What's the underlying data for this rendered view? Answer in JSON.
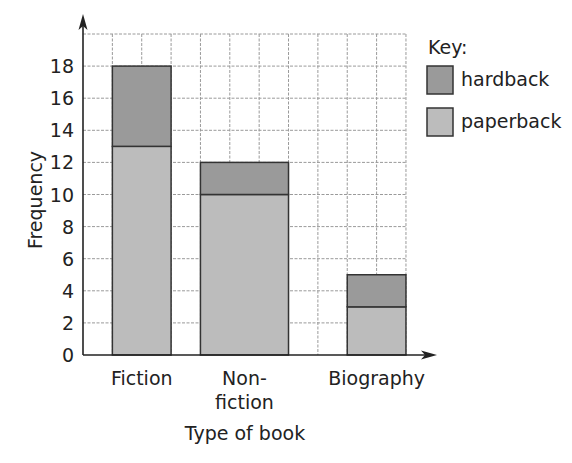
{
  "chart_data": {
    "type": "bar",
    "stacked": true,
    "title": "",
    "xlabel": "Type of book",
    "ylabel": "Frequency",
    "categories": [
      "Fiction",
      "Non-fiction",
      "Biography"
    ],
    "category_label_lines": [
      [
        "Fiction"
      ],
      [
        "Non-",
        "fiction"
      ],
      [
        "Biography"
      ]
    ],
    "series": [
      {
        "name": "paperback",
        "values": [
          13,
          10,
          3
        ],
        "color": "#bcbcbc"
      },
      {
        "name": "hardback",
        "values": [
          5,
          2,
          2
        ],
        "color": "#9a9a9a"
      }
    ],
    "totals": [
      18,
      12,
      5
    ],
    "ylim": [
      0,
      20
    ],
    "yticks": [
      0,
      2,
      4,
      6,
      8,
      10,
      12,
      14,
      16,
      18
    ],
    "grid": true,
    "legend": {
      "title": "Key:",
      "position": "right",
      "entries": [
        {
          "label": "hardback",
          "color": "#9a9a9a"
        },
        {
          "label": "paperback",
          "color": "#bcbcbc"
        }
      ]
    }
  },
  "layout": {
    "axis_x0": 83,
    "baseline_y": 355,
    "unit_px": 16.05,
    "col_px": 29.36,
    "num_cols": 11,
    "bar_cols": [
      [
        1,
        3
      ],
      [
        4,
        7
      ],
      [
        9,
        11
      ]
    ]
  }
}
